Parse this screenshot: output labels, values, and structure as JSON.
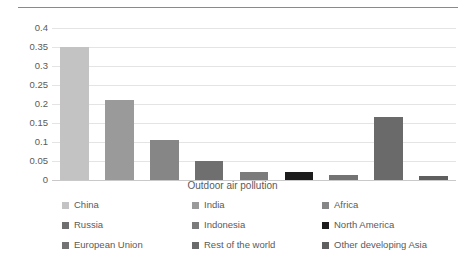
{
  "chart_data": {
    "type": "bar",
    "title": "",
    "subtitle": "",
    "xlabel": "Outdoor air pollution",
    "ylabel": "",
    "categories": [
      "China",
      "India",
      "Africa",
      "Russia",
      "Indonesia",
      "North America",
      "European Union",
      "Rest of the world",
      "Other developing Asia"
    ],
    "values": [
      0.35,
      0.21,
      0.105,
      0.05,
      0.02,
      0.02,
      0.012,
      0.165,
      0.01
    ],
    "ylim": [
      0,
      0.4
    ],
    "ytick_step": 0.05,
    "yticks": [
      "0",
      "0.05",
      "0.1",
      "0.15",
      "0.2",
      "0.25",
      "0.3",
      "0.35",
      "0.4"
    ],
    "ytick_values": [
      0,
      0.05,
      0.1,
      0.15,
      0.2,
      0.25,
      0.3,
      0.35,
      0.4
    ],
    "grid": true,
    "grid_axis": "y",
    "legend_position": "bottom",
    "legend_columns": 3,
    "colors": [
      "#c3c3c3",
      "#9a9a9a",
      "#868686",
      "#6f6f6f",
      "#7b7b7b",
      "#1c1c1c",
      "#737373",
      "#6a6a6a",
      "#5f5f5f"
    ]
  },
  "axis": {
    "x_title": "Outdoor air pollution"
  },
  "legend": {
    "items": [
      {
        "label": "China",
        "color": "#c3c3c3"
      },
      {
        "label": "India",
        "color": "#9a9a9a"
      },
      {
        "label": "Africa",
        "color": "#868686"
      },
      {
        "label": "Russia",
        "color": "#6f6f6f"
      },
      {
        "label": "Indonesia",
        "color": "#7b7b7b"
      },
      {
        "label": "North America",
        "color": "#1c1c1c"
      },
      {
        "label": "European Union",
        "color": "#737373"
      },
      {
        "label": "Rest of the world",
        "color": "#6a6a6a"
      },
      {
        "label": "Other developing Asia",
        "color": "#5f5f5f"
      }
    ]
  }
}
